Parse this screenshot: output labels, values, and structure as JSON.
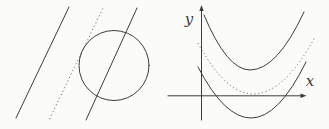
{
  "colors": {
    "background": "#fbfbfa",
    "stroke": "#3d3d3d",
    "dotted_stroke": "#575757"
  },
  "left_panel": {
    "circle": {
      "cx": 114,
      "cy": 65.5,
      "r": 35
    },
    "lines": [
      {
        "name": "line-disjoint",
        "x1": 16,
        "y1": 118,
        "x2": 69,
        "y2": 7,
        "dotted": false
      },
      {
        "name": "line-tangent-dotted",
        "x1": 49.5,
        "y1": 119,
        "x2": 104,
        "y2": 6,
        "dotted": true
      },
      {
        "name": "line-secant",
        "x1": 86,
        "y1": 120,
        "x2": 137,
        "y2": 8,
        "dotted": false
      }
    ]
  },
  "right_panel": {
    "x_axis": {
      "y": 95.8,
      "x1": 168,
      "x2": 301.5,
      "label": "x",
      "label_x": 310,
      "label_y": 86
    },
    "y_axis": {
      "x": 201.5,
      "y1": 120,
      "y2": 10,
      "label": "y",
      "label_x": 189,
      "label_y": 24
    },
    "parabolas": [
      {
        "name": "parabola-no-intersection",
        "vx": 250,
        "vy": 70,
        "left": [
          204,
          15
        ],
        "right": [
          304,
          12
        ],
        "dotted": false
      },
      {
        "name": "parabola-tangent-dotted",
        "vx": 253,
        "vy": 94,
        "left": [
          198,
          43
        ],
        "right": [
          315,
          37
        ],
        "dotted": true
      },
      {
        "name": "parabola-two-intersections",
        "vx": 251,
        "vy": 118,
        "left": [
          198,
          67
        ],
        "right": [
          306,
          62
        ],
        "dotted": false
      }
    ]
  }
}
